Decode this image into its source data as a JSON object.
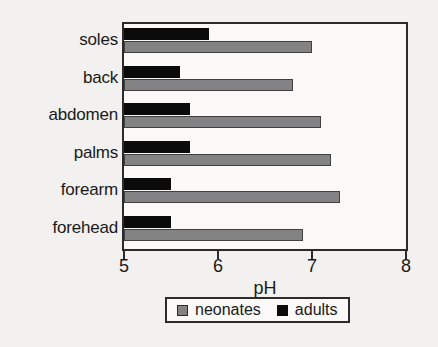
{
  "chart_data": {
    "type": "bar",
    "orientation": "horizontal",
    "title": "",
    "subtitle": "",
    "xlabel": "pH",
    "ylabel": "",
    "categories": [
      "soles",
      "back",
      "abdomen",
      "palms",
      "forearm",
      "forehead"
    ],
    "series": [
      {
        "name": "neonates",
        "color": "#838383",
        "values": [
          7.0,
          6.8,
          7.1,
          7.2,
          7.3,
          6.9
        ]
      },
      {
        "name": "adults",
        "color": "#0b0b0b",
        "values": [
          5.9,
          5.6,
          5.7,
          5.7,
          5.5,
          5.5
        ]
      }
    ],
    "xlim": [
      5,
      8
    ],
    "xticks": [
      5,
      6,
      7,
      8
    ],
    "xtick_labels": [
      "5",
      "6",
      "7",
      "8"
    ],
    "grid": false,
    "legend_position": "bottom"
  },
  "legend": {
    "entries": [
      {
        "label": "neonates",
        "swatch": "gray-square-swatch"
      },
      {
        "label": "adults",
        "swatch": "black-square-swatch"
      }
    ]
  },
  "axis": {
    "x_title": "pH",
    "tick_labels": [
      "5",
      "6",
      "7",
      "8"
    ]
  },
  "colors": {
    "neonates": "#838383",
    "adults": "#0b0b0b",
    "frame": "#2b2b2b",
    "background": "#f2f1ef",
    "plot_background": "#faf9f7",
    "text": "#1a1a1a"
  }
}
